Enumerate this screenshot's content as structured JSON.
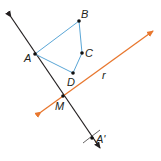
{
  "diagram": {
    "colors": {
      "line_black": "#231f20",
      "polygon_blue": "#5aa6d6",
      "line_orange": "#e8772e",
      "point": "#111111"
    },
    "points": {
      "A": {
        "label": "A",
        "x": 35,
        "y": 54
      },
      "B": {
        "label": "B",
        "x": 79,
        "y": 21
      },
      "C": {
        "label": "C",
        "x": 82,
        "y": 53
      },
      "D": {
        "label": "D",
        "x": 73,
        "y": 73
      },
      "M": {
        "label": "M",
        "x": 63,
        "y": 96
      },
      "A_prime": {
        "label": "A'",
        "x": 92,
        "y": 138
      }
    },
    "line_r": {
      "label": "r"
    },
    "polygon": [
      "A",
      "B",
      "C",
      "D"
    ]
  }
}
